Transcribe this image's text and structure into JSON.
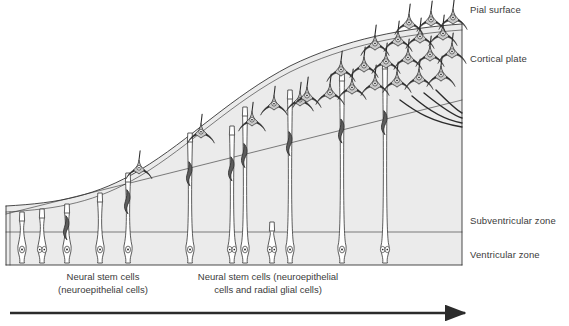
{
  "figure": {
    "type": "scientific-diagram",
    "background_color": "#ffffff",
    "ink_color": "#2b2b2b",
    "zone_fill_color": "#ebebeb",
    "label_color": "#3b3b3b"
  },
  "zone_labels": [
    {
      "id": "pial-surface",
      "text": "Pial surface",
      "x": 470,
      "y": 4
    },
    {
      "id": "cortical-plate",
      "text": "Cortical plate",
      "x": 470,
      "y": 53
    },
    {
      "id": "subventricular-zone",
      "text": "Subventricular zone",
      "x": 470,
      "y": 215
    },
    {
      "id": "ventricular-zone",
      "text": "Ventricular zone",
      "x": 470,
      "y": 249
    }
  ],
  "captions": [
    {
      "id": "caption-left",
      "lines": [
        "Neural stem cells",
        "(neuroepithelial cells)"
      ],
      "center_x": 103,
      "y": 271
    },
    {
      "id": "caption-right",
      "lines": [
        "Neural stem cells (neuroepithelial",
        "cells and radial glial cells)"
      ],
      "center_x": 268,
      "y": 271
    }
  ],
  "time_axis": {
    "id": "time-arrow",
    "label": "Time",
    "x_start": 10,
    "x_end": 465,
    "y": 313,
    "direction": "right"
  },
  "frame": {
    "left_x": 6,
    "right_x": 462,
    "bottom_y": 265,
    "ventricular_top_y": 232
  },
  "boundaries": {
    "pial_surface_path": "M 6,206 C 60,203 96,196 140,170 C 190,140 232,96 290,66 C 345,39 405,28 462,24",
    "cortical_plate_lower_path": "M 6,214 L 462,100",
    "subventricular_lower_path": "M 6,232 L 462,232",
    "left_inner_edge_x": 10
  },
  "progenitor_cells": [
    {
      "id": "npc-1",
      "x": 22,
      "top_y": 212,
      "nuclei": 1,
      "fiber": false,
      "glia": false
    },
    {
      "id": "npc-2",
      "x": 42,
      "top_y": 209,
      "nuclei": 2,
      "fiber": false,
      "glia": false
    },
    {
      "id": "npc-3",
      "x": 67,
      "top_y": 204,
      "nuclei": 1,
      "fiber": false,
      "glia": true
    },
    {
      "id": "npc-4",
      "x": 100,
      "top_y": 193,
      "nuclei": 1,
      "fiber": false,
      "glia": false
    },
    {
      "id": "npc-5",
      "x": 128,
      "top_y": 173,
      "nuclei": 1,
      "fiber": false,
      "glia": true
    },
    {
      "id": "npc-6",
      "x": 190,
      "top_y": 133,
      "nuclei": 1,
      "fiber": false,
      "glia": true
    },
    {
      "id": "npc-7",
      "x": 232,
      "top_y": 126,
      "nuclei": 2,
      "fiber": false,
      "glia": true
    },
    {
      "id": "npc-8",
      "x": 245,
      "top_y": 107,
      "nuclei": 1,
      "fiber": false,
      "glia": true
    },
    {
      "id": "npc-9",
      "x": 272,
      "top_y": 222,
      "nuclei": 2,
      "fiber": false,
      "glia": false
    },
    {
      "id": "npc-10",
      "x": 290,
      "top_y": 90,
      "nuclei": 1,
      "fiber": false,
      "glia": true
    },
    {
      "id": "npc-11",
      "x": 342,
      "top_y": 72,
      "nuclei": 1,
      "fiber": false,
      "glia": true
    },
    {
      "id": "npc-12",
      "x": 385,
      "top_y": 60,
      "nuclei": 2,
      "fiber": false,
      "glia": true
    }
  ],
  "migrating_neurons": [
    {
      "id": "mig-1",
      "x": 139,
      "y": 172,
      "scale": 0.92
    },
    {
      "id": "mig-2",
      "x": 201,
      "y": 136,
      "scale": 0.95
    },
    {
      "id": "mig-3",
      "x": 252,
      "y": 124,
      "scale": 0.95
    },
    {
      "id": "mig-4",
      "x": 274,
      "y": 108,
      "scale": 0.95
    },
    {
      "id": "mig-5",
      "x": 300,
      "y": 104,
      "scale": 0.95
    }
  ],
  "cortical_neurons": [
    {
      "id": "cp-1",
      "x": 307,
      "y": 100,
      "scale": 1.0
    },
    {
      "id": "cp-2",
      "x": 330,
      "y": 97,
      "scale": 1.0
    },
    {
      "id": "cp-3",
      "x": 352,
      "y": 92,
      "scale": 1.0
    },
    {
      "id": "cp-4",
      "x": 375,
      "y": 88,
      "scale": 1.0
    },
    {
      "id": "cp-5",
      "x": 397,
      "y": 85,
      "scale": 1.0
    },
    {
      "id": "cp-6",
      "x": 419,
      "y": 82,
      "scale": 1.0
    },
    {
      "id": "cp-7",
      "x": 441,
      "y": 79,
      "scale": 1.0
    },
    {
      "id": "cp-8",
      "x": 341,
      "y": 74,
      "scale": 1.0
    },
    {
      "id": "cp-9",
      "x": 364,
      "y": 70,
      "scale": 1.0
    },
    {
      "id": "cp-10",
      "x": 386,
      "y": 66,
      "scale": 1.0
    },
    {
      "id": "cp-11",
      "x": 408,
      "y": 62,
      "scale": 1.0
    },
    {
      "id": "cp-12",
      "x": 430,
      "y": 59,
      "scale": 1.0
    },
    {
      "id": "cp-13",
      "x": 452,
      "y": 56,
      "scale": 1.0
    },
    {
      "id": "cp-14",
      "x": 375,
      "y": 48,
      "scale": 1.0
    },
    {
      "id": "cp-15",
      "x": 398,
      "y": 44,
      "scale": 1.0
    },
    {
      "id": "cp-16",
      "x": 420,
      "y": 41,
      "scale": 1.0
    },
    {
      "id": "cp-17",
      "x": 443,
      "y": 38,
      "scale": 1.0
    },
    {
      "id": "cp-18",
      "x": 409,
      "y": 27,
      "scale": 1.0
    },
    {
      "id": "cp-19",
      "x": 431,
      "y": 24,
      "scale": 1.0
    },
    {
      "id": "cp-20",
      "x": 453,
      "y": 22,
      "scale": 1.0
    }
  ],
  "descending_fibers": [
    {
      "id": "fiber-1",
      "path": "M 400,100 C 416,112 432,122 462,127"
    },
    {
      "id": "fiber-2",
      "path": "M 412,96  C 428,110 444,120 462,123"
    },
    {
      "id": "fiber-3",
      "path": "M 424,93  C 440,106 452,115 462,118"
    },
    {
      "id": "fiber-4",
      "path": "M 436,90  C 448,102 456,110 462,113"
    }
  ]
}
